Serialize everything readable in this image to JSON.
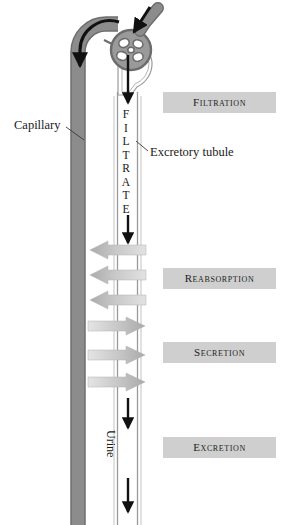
{
  "figure": {
    "colors": {
      "capillary_fill": "#8c8c8c",
      "capillary_stroke": "#6f6f6f",
      "tubule_stroke": "#9a9a9a",
      "process_box_fill": "#cfcfcf",
      "arrow_dark": "#111111",
      "reabsorption_arrow": "#c6c6c6",
      "secretion_arrow": "#bdbdbd",
      "background": "#ffffff"
    }
  },
  "process_boxes": [
    {
      "label": "Filtration",
      "name": "filtration"
    },
    {
      "label": "Reabsorption",
      "name": "reabsorption"
    },
    {
      "label": "Secretion",
      "name": "secretion"
    },
    {
      "label": "Excretion",
      "name": "excretion"
    }
  ],
  "callouts": {
    "capillary": "Capillary",
    "excretory_tubule": "Excretory tubule"
  },
  "flow_labels": {
    "filtrate": "FILTRATE",
    "filtrate_letters": [
      "F",
      "I",
      "L",
      "T",
      "R",
      "A",
      "T",
      "E"
    ],
    "urine": "Urine"
  },
  "structures": {
    "glomerulus": "glomerulus",
    "bowmans_capsule": "Bowman's capsule",
    "afferent_arteriole": "afferent arteriole",
    "efferent_arteriole": "efferent arteriole"
  },
  "exchange_arrows": {
    "reabsorption_count": 3,
    "reabsorption_direction": "tubule-to-capillary (left)",
    "secretion_count": 3,
    "secretion_direction": "capillary-to-tubule (right)"
  }
}
